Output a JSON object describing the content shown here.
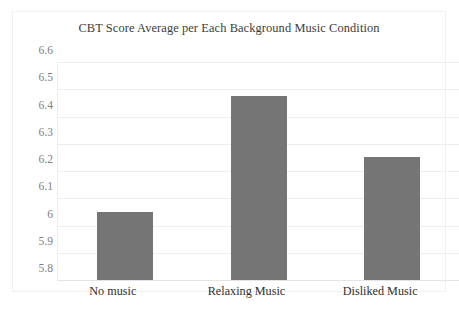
{
  "chart_data": {
    "type": "bar",
    "title": "CBT Score Average per Each Background Music Condition",
    "xlabel": "",
    "ylabel": "",
    "categories": [
      "No music",
      "Relaxing Music",
      "Disliked Music"
    ],
    "values": [
      6.05,
      6.475,
      6.25
    ],
    "series": [
      {
        "name": "CBT Score Average",
        "values": [
          6.05,
          6.475,
          6.25
        ]
      }
    ],
    "ylim": [
      5.8,
      6.6
    ],
    "ytick_step": 0.1,
    "ytick_labels": [
      "6.6",
      "6.5",
      "6.4",
      "6.3",
      "6.2",
      "6.1",
      "6",
      "5.9",
      "5.8"
    ],
    "ytick_values": [
      6.6,
      6.5,
      6.4,
      6.3,
      6.2,
      6.1,
      6.0,
      5.9,
      5.8
    ],
    "grid": true,
    "grid_axis": "y",
    "legend": false,
    "legend_position": "none",
    "bar_color": "#757575",
    "grid_color": "#ededed",
    "title_color": "#3b3b3b",
    "tick_label_color": "#808080",
    "category_label_color": "#2f2f2f",
    "background_color": "#ffffff",
    "border_color": "#f0f0f0"
  }
}
